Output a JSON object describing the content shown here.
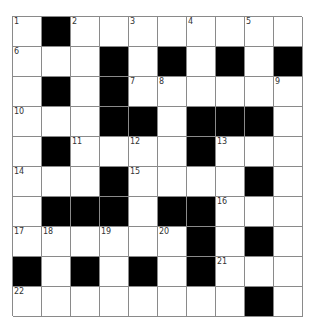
{
  "puzzle": {
    "rows": 10,
    "cols": 10,
    "colors": {
      "block": "#000000",
      "cell": "#ffffff",
      "gridline": "#8a8a8a",
      "number": "#333333"
    },
    "layout": [
      "#.########"
    ],
    "grid": [
      [
        "W",
        "B",
        "W",
        "W",
        "W",
        "W",
        "W",
        "W",
        "W",
        "W"
      ],
      [
        "W",
        "W",
        "W",
        "B",
        "W",
        "B",
        "W",
        "B",
        "W",
        "B"
      ],
      [
        "W",
        "B",
        "W",
        "B",
        "W",
        "W",
        "W",
        "W",
        "W",
        "W"
      ],
      [
        "W",
        "W",
        "W",
        "B",
        "B",
        "W",
        "B",
        "B",
        "B",
        "W"
      ],
      [
        "W",
        "B",
        "W",
        "W",
        "W",
        "W",
        "B",
        "W",
        "W",
        "W"
      ],
      [
        "W",
        "W",
        "W",
        "B",
        "W",
        "W",
        "W",
        "W",
        "B",
        "W"
      ],
      [
        "W",
        "B",
        "B",
        "B",
        "W",
        "B",
        "B",
        "W",
        "W",
        "W"
      ],
      [
        "W",
        "W",
        "W",
        "W",
        "W",
        "W",
        "B",
        "W",
        "B",
        "W"
      ],
      [
        "B",
        "W",
        "B",
        "W",
        "B",
        "W",
        "B",
        "W",
        "W",
        "W"
      ],
      [
        "W",
        "W",
        "W",
        "W",
        "W",
        "W",
        "W",
        "W",
        "B",
        "W"
      ]
    ],
    "numbers": [
      {
        "row": 0,
        "col": 0,
        "n": "1"
      },
      {
        "row": 0,
        "col": 2,
        "n": "2"
      },
      {
        "row": 0,
        "col": 4,
        "n": "3"
      },
      {
        "row": 0,
        "col": 6,
        "n": "4"
      },
      {
        "row": 0,
        "col": 8,
        "n": "5"
      },
      {
        "row": 1,
        "col": 0,
        "n": "6"
      },
      {
        "row": 2,
        "col": 4,
        "n": "7"
      },
      {
        "row": 2,
        "col": 5,
        "n": "8"
      },
      {
        "row": 2,
        "col": 9,
        "n": "9"
      },
      {
        "row": 3,
        "col": 0,
        "n": "10"
      },
      {
        "row": 4,
        "col": 2,
        "n": "11"
      },
      {
        "row": 4,
        "col": 4,
        "n": "12"
      },
      {
        "row": 4,
        "col": 7,
        "n": "13"
      },
      {
        "row": 5,
        "col": 0,
        "n": "14"
      },
      {
        "row": 5,
        "col": 4,
        "n": "15"
      },
      {
        "row": 6,
        "col": 7,
        "n": "16"
      },
      {
        "row": 7,
        "col": 0,
        "n": "17"
      },
      {
        "row": 7,
        "col": 1,
        "n": "18"
      },
      {
        "row": 7,
        "col": 3,
        "n": "19"
      },
      {
        "row": 7,
        "col": 5,
        "n": "20"
      },
      {
        "row": 8,
        "col": 7,
        "n": "21"
      },
      {
        "row": 9,
        "col": 0,
        "n": "22"
      }
    ]
  }
}
